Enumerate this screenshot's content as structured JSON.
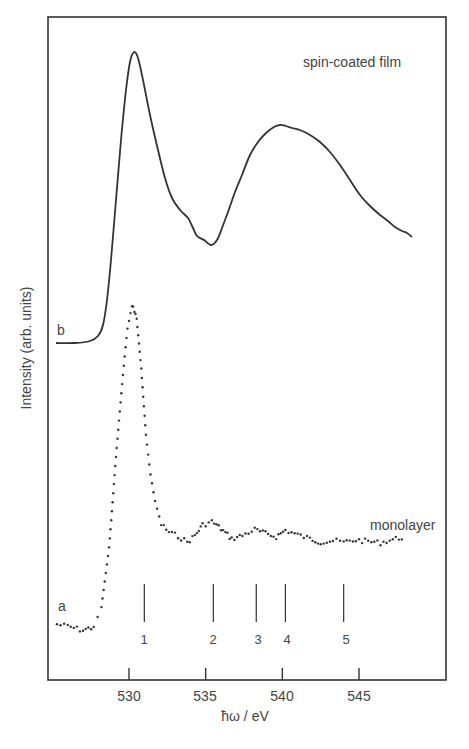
{
  "chart_data": {
    "type": "line",
    "title": "",
    "xlabel": "ħω / eV",
    "ylabel": "Intensity (arb. units)",
    "xlim": [
      524.7,
      550.6
    ],
    "ylim": [
      0,
      100
    ],
    "x_ticks": [
      530,
      535,
      540,
      545
    ],
    "x_tick_labels": [
      "530",
      "535",
      "540",
      "545"
    ],
    "y_ticks": [],
    "grid": false,
    "legend": "none (inline curve labels)",
    "series": [
      {
        "name": "spin-coated film",
        "curve_label": "b",
        "style": "solid line",
        "x": [
          525.2,
          527.0,
          527.7,
          528.7,
          529.4,
          530.0,
          530.3,
          531.0,
          532.0,
          532.8,
          533.6,
          534.3,
          535.3,
          536.2,
          537.2,
          538.2,
          539.2,
          540.0,
          541.1,
          542.4,
          543.7,
          545.0,
          546.3,
          547.3,
          548.4
        ],
        "values": [
          51.3,
          51.6,
          51.0,
          44.1,
          36.2,
          24.4,
          94.6,
          87.3,
          77.5,
          71.5,
          69.2,
          66.9,
          65.5,
          69.9,
          76.0,
          81.3,
          83.1,
          83.6,
          82.8,
          80.5,
          76.8,
          73.0,
          70.0,
          68.3,
          66.8
        ]
      },
      {
        "name": "monolayer",
        "curve_label": "a",
        "style": "dotted (data points)",
        "x": [
          525.3,
          526.0,
          527.0,
          527.7,
          528.2,
          528.7,
          529.2,
          529.6,
          529.9,
          530.2,
          530.5,
          530.8,
          531.1,
          531.4,
          531.7,
          532.1,
          532.6,
          533.2,
          533.8,
          534.3,
          534.8,
          535.4,
          536.0,
          536.7,
          537.4,
          538.2,
          538.9,
          539.6,
          540.2,
          541.0,
          541.8,
          542.5,
          543.3,
          544.0,
          544.8,
          545.6,
          546.4,
          547.2,
          548.0
        ],
        "values": [
          8.4,
          8.1,
          7.5,
          8.0,
          11.0,
          20.0,
          35.0,
          46.0,
          53.0,
          56.5,
          54.5,
          47.0,
          37.0,
          31.0,
          27.0,
          23.5,
          22.3,
          21.7,
          20.8,
          21.8,
          23.4,
          23.9,
          22.8,
          21.3,
          21.8,
          22.7,
          22.1,
          21.6,
          22.6,
          21.9,
          21.3,
          20.8,
          21.0,
          20.8,
          21.1,
          20.9,
          20.7,
          21.2,
          21.6
        ]
      }
    ],
    "annotations": {
      "markers": [
        {
          "label": "1",
          "x": 531.0
        },
        {
          "label": "2",
          "x": 535.5
        },
        {
          "label": "3",
          "x": 538.3
        },
        {
          "label": "4",
          "x": 540.2
        },
        {
          "label": "5",
          "x": 544.0
        }
      ]
    }
  },
  "labels": {
    "spin_coated": "spin-coated film",
    "monolayer": "monolayer",
    "curve_b": "b",
    "curve_a": "a",
    "ylabel": "Intensity (arb. units)",
    "xlabel": "ħω / eV",
    "ticks": [
      "530",
      "535",
      "540",
      "545"
    ],
    "markers": [
      "1",
      "2",
      "3",
      "4",
      "5"
    ]
  }
}
